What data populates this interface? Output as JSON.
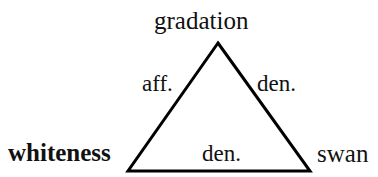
{
  "figure": {
    "type": "semantic-triangle-diagram",
    "background_color": "#ffffff",
    "stroke_color": "#000000"
  },
  "diagram": {
    "shape": "triangle",
    "vertices": [
      {
        "id": "apex",
        "label": "gradation",
        "x": 218,
        "y": 43,
        "weight": "normal"
      },
      {
        "id": "bottom-left",
        "label": "whiteness",
        "x": 128,
        "y": 171,
        "weight": "bold"
      },
      {
        "id": "bottom-right",
        "label": "swan",
        "x": 310,
        "y": 171,
        "weight": "normal"
      }
    ],
    "edges": [
      {
        "id": "left-edge",
        "from": "bottom-left",
        "to": "apex",
        "label": "aff."
      },
      {
        "id": "right-edge",
        "from": "apex",
        "to": "bottom-right",
        "label": "den."
      },
      {
        "id": "bottom-edge",
        "from": "bottom-left",
        "to": "bottom-right",
        "label": "den."
      }
    ]
  }
}
